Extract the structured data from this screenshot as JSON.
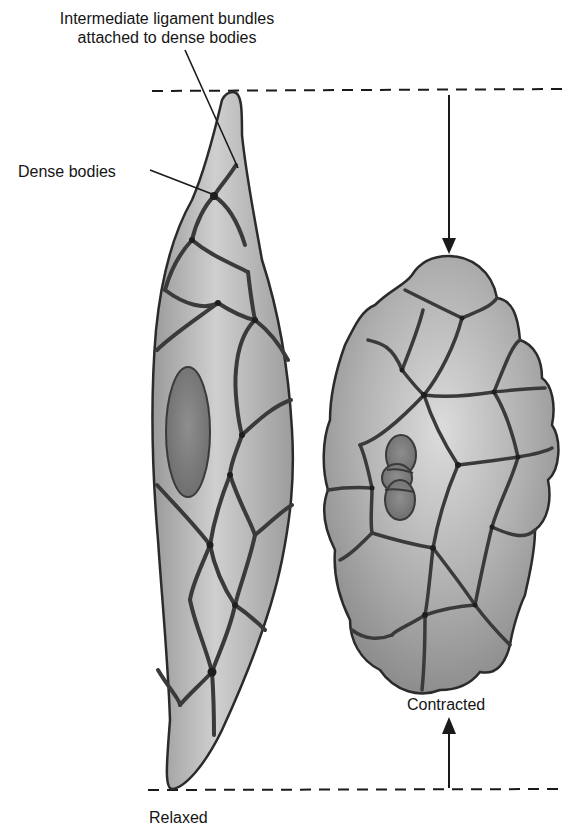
{
  "figure": {
    "labels": {
      "ligament_line1": "Intermediate ligament bundles",
      "ligament_line2": "attached to dense bodies",
      "dense_bodies": "Dense bodies",
      "contracted": "Contracted",
      "relaxed": "Relaxed"
    },
    "cells": [
      {
        "id": "relaxed",
        "shape": "elongated spindle",
        "nucleus": "elongated oval"
      },
      {
        "id": "contracted",
        "shape": "rounded lobulated",
        "nucleus": "corkscrew/folded"
      }
    ],
    "indicators": {
      "top_dashed_line": "upper length reference",
      "bottom_dashed_line": "lower length reference",
      "down_arrow": "top of contracted cell",
      "up_arrow": "bottom of contracted cell"
    },
    "colors": {
      "cell_fill": "#a9a9a9",
      "cell_highlight": "#d6d6d6",
      "outline": "#2b2b2b",
      "nucleus": "#7d7d7d",
      "text": "#151515"
    }
  }
}
